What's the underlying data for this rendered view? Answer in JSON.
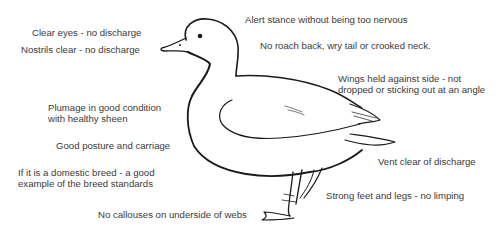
{
  "diagram": {
    "labels": {
      "clear_eyes": "Clear eyes - no discharge",
      "nostrils": "Nostrils clear - no discharge",
      "alert_stance": "Alert stance without being too nervous",
      "no_roach_back": "No roach back, wry tail or crooked neck.",
      "wings_line1": "Wings held against side - not",
      "wings_line2": "dropped or sticking out at an angle",
      "plumage_line1": "Plumage in good condition",
      "plumage_line2": "with healthy sheen",
      "posture": "Good posture and carriage",
      "breed_line1": "If it is a domestic breed - a good",
      "breed_line2": "example of the breed standards",
      "vent": "Vent clear of discharge",
      "feet_legs": "Strong feet and legs - no limping",
      "webs": "No callouses on underside of webs"
    }
  }
}
